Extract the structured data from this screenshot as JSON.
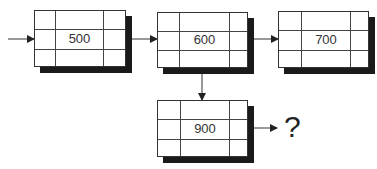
{
  "diagram": {
    "type": "linked-list-nodes",
    "nodes": [
      {
        "id": "n500",
        "value": "500"
      },
      {
        "id": "n600",
        "value": "600"
      },
      {
        "id": "n700",
        "value": "700"
      },
      {
        "id": "n900",
        "value": "900"
      }
    ],
    "edges": [
      {
        "from": "start",
        "to": "n500"
      },
      {
        "from": "n500",
        "to": "n600"
      },
      {
        "from": "n600",
        "to": "n700"
      },
      {
        "from": "n600",
        "to": "n900"
      },
      {
        "from": "n900",
        "to": "unknown"
      }
    ],
    "unknown_label": "?"
  },
  "colors": {
    "line": "#333333",
    "shadow": "#1a1a1a",
    "background": "#ffffff"
  }
}
